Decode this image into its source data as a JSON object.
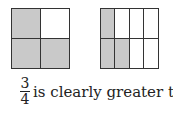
{
  "figure": {
    "left_model": {
      "rows": 2,
      "cols": 2,
      "shaded": [
        0,
        2,
        3
      ],
      "fraction": "3/4"
    },
    "right_model": {
      "rows": 2,
      "cols": 4,
      "shaded": [
        0,
        4,
        5
      ],
      "fraction": "3/8"
    },
    "shade_color": "#c9c9c9"
  },
  "caption": {
    "frac1_num": "3",
    "frac1_den": "4",
    "text": "is clearly greater than",
    "frac2_num": "3",
    "frac2_den": "8"
  }
}
